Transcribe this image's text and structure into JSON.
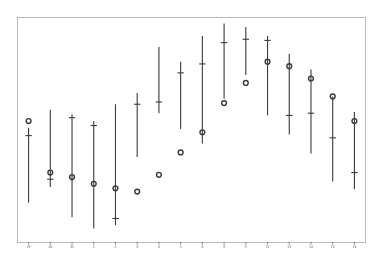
{
  "chart_data": {
    "type": "scatter",
    "title": "",
    "subtitle": "",
    "xlabel": "",
    "ylabel": "",
    "grid": false,
    "legend": null,
    "xlim": [
      0.5,
      16.5
    ],
    "ylim": [
      0,
      100
    ],
    "categories": [
      "29",
      "30",
      "31",
      "1",
      "2",
      "3",
      "4",
      "5",
      "6",
      "8",
      "9",
      "12",
      "13",
      "14",
      "15",
      "16"
    ],
    "axis": {
      "x_tick_labels": [
        "29",
        "30",
        "31",
        "1",
        "2",
        "3",
        "4",
        "5",
        "6",
        "8",
        "9",
        "12",
        "13",
        "14",
        "15",
        "16"
      ],
      "y_tick_labels": [],
      "frame_color": "#b9b9b9",
      "tick_color": "#5a5a5a"
    },
    "style": {
      "line_color": "#3a3a3a",
      "marker_color": "#3a3a3a",
      "marker_shape": "open-circle",
      "background": "#ffffff",
      "line_width": 1.1
    },
    "series": [
      {
        "name": "range-bar",
        "type": "range",
        "description": "vertical line from low to high with an interior cap marker",
        "values": [
          {
            "x": "29",
            "low": 17.5,
            "high": 51.0,
            "cap": 47.5
          },
          {
            "x": "30",
            "low": 24.5,
            "high": 59.0,
            "cap": 28.0
          },
          {
            "x": "31",
            "low": 11.0,
            "high": 57.0,
            "cap": 55.5
          },
          {
            "x": "1",
            "low": 6.0,
            "high": 54.0,
            "cap": 52.0
          },
          {
            "x": "2",
            "low": 7.5,
            "high": 61.5,
            "cap": 10.5
          },
          {
            "x": "3",
            "low": 38.0,
            "high": 66.5,
            "cap": 61.5
          },
          {
            "x": "4",
            "low": 57.5,
            "high": 87.0,
            "cap": 62.5
          },
          {
            "x": "5",
            "low": 50.5,
            "high": 80.5,
            "cap": 75.5
          },
          {
            "x": "6",
            "low": 44.0,
            "high": 92.0,
            "cap": 79.5
          },
          {
            "x": "8",
            "low": 64.0,
            "high": 97.5,
            "cap": 89.0
          },
          {
            "x": "9",
            "low": 74.5,
            "high": 96.0,
            "cap": 90.5
          },
          {
            "x": "12",
            "low": 56.5,
            "high": 92.0,
            "cap": 90.0
          },
          {
            "x": "13",
            "low": 48.0,
            "high": 84.0,
            "cap": 56.5
          },
          {
            "x": "14",
            "low": 39.5,
            "high": 77.0,
            "cap": 57.5
          },
          {
            "x": "15",
            "low": 27.0,
            "high": 65.0,
            "cap": 46.5
          },
          {
            "x": "16",
            "low": 23.5,
            "high": 58.0,
            "cap": 31.0
          }
        ]
      },
      {
        "name": "point-estimate",
        "type": "marker",
        "description": "open circle marker",
        "values": [
          {
            "x": "29",
            "y": 54.0
          },
          {
            "x": "30",
            "y": 31.0
          },
          {
            "x": "31",
            "y": 29.0
          },
          {
            "x": "1",
            "y": 26.0
          },
          {
            "x": "2",
            "y": 24.0
          },
          {
            "x": "3",
            "y": 22.5
          },
          {
            "x": "4",
            "y": 30.0
          },
          {
            "x": "5",
            "y": 40.0
          },
          {
            "x": "6",
            "y": 49.0
          },
          {
            "x": "8",
            "y": 62.0
          },
          {
            "x": "9",
            "y": 71.0
          },
          {
            "x": "12",
            "y": 80.5
          },
          {
            "x": "13",
            "y": 78.5
          },
          {
            "x": "14",
            "y": 73.0
          },
          {
            "x": "15",
            "y": 65.0
          },
          {
            "x": "16",
            "y": 54.0
          }
        ]
      }
    ]
  }
}
